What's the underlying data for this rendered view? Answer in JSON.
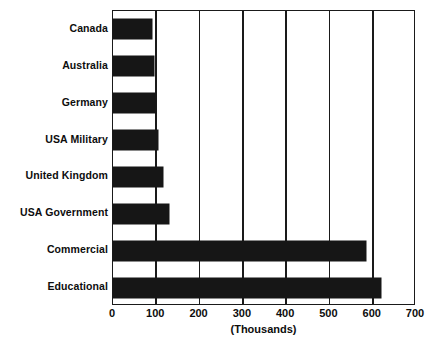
{
  "chart_data": {
    "type": "bar",
    "orientation": "horizontal",
    "title": "",
    "subtitle": "",
    "xlabel": "(Thousands)",
    "ylabel": "",
    "xlim": [
      0,
      700
    ],
    "xticks": [
      0,
      100,
      200,
      300,
      400,
      500,
      600,
      700
    ],
    "xtick_labels": [
      "0",
      "100",
      "200",
      "300",
      "400",
      "500",
      "600",
      "700"
    ],
    "grid": "vertical",
    "legend": "none",
    "categories": [
      "Canada",
      "Australia",
      "Germany",
      "USA Military",
      "United Kingdom",
      "USA Government",
      "Commercial",
      "Educational"
    ],
    "values": [
      90,
      95,
      100,
      105,
      115,
      130,
      585,
      620
    ],
    "bar_color": "#161616",
    "axis_color": "#1a1a1a",
    "background_color": "#ffffff"
  },
  "caption_remnant": ""
}
